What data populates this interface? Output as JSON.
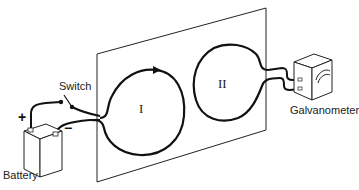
{
  "diagram": {
    "title": "",
    "labels": {
      "switch": "Switch",
      "battery": "Battery",
      "galvanometer": "Galvanometer",
      "loop_1": "I",
      "loop_2": "II",
      "plus": "+",
      "minus": "−"
    },
    "components": [
      {
        "id": "battery",
        "label": "Battery",
        "terminals": [
          "+",
          "−"
        ]
      },
      {
        "id": "switch",
        "label": "Switch",
        "state": "open"
      },
      {
        "id": "loop_1",
        "label": "I",
        "connected_to": [
          "battery",
          "switch"
        ],
        "has_direction_arrow": true
      },
      {
        "id": "loop_2",
        "label": "II",
        "connected_to": [
          "galvanometer"
        ]
      },
      {
        "id": "plane",
        "label": ""
      },
      {
        "id": "galvanometer",
        "label": "Galvanometer"
      }
    ],
    "colors": {
      "line": "#111111",
      "background": "#ffffff"
    }
  }
}
